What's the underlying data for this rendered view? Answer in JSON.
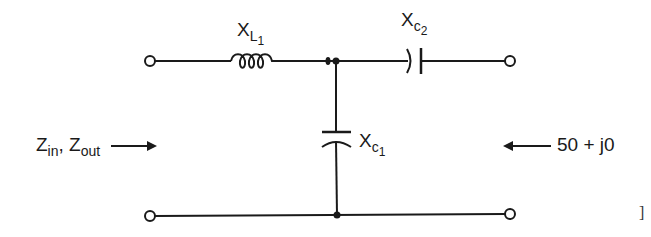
{
  "diagram": {
    "type": "L-network impedance matching circuit",
    "components": {
      "series_inductor": {
        "label_main": "X",
        "label_sub": "L",
        "label_subsub": "1"
      },
      "series_capacitor": {
        "label_main": "X",
        "label_sub": "c",
        "label_subsub": "2"
      },
      "shunt_capacitor": {
        "label_main": "X",
        "label_sub": "c",
        "label_subsub": "1"
      }
    },
    "left_port": {
      "label_z1": "Z",
      "label_z1_sub": "in",
      "separator": ",",
      "label_z2": "Z",
      "label_z2_sub": "out"
    },
    "right_port": {
      "label": "50 + j0"
    },
    "margin_mark": "]",
    "colors": {
      "ink": "#1a1a1a",
      "background": "#ffffff"
    }
  }
}
